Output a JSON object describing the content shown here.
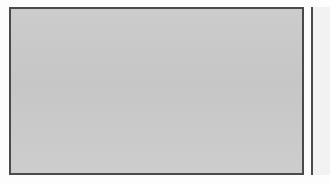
{
  "chart_data": {
    "type": "line",
    "xlabel": "",
    "ylabel": "Rate per 1,000 women",
    "ylim": [
      0,
      45
    ],
    "yticks": [
      0,
      10,
      20,
      30,
      40
    ],
    "xlim": [
      1993,
      2009
    ],
    "xticks": [
      1994,
      1996,
      1998,
      2000,
      2002,
      2004,
      2006,
      2008
    ],
    "x": [
      1993,
      1994,
      1995,
      1996,
      1997,
      1998,
      1999,
      2000,
      2001,
      2002,
      2003,
      2004,
      2005,
      2006,
      2007,
      2008,
      2009
    ],
    "grid": "horizontal",
    "legend_position": "top-center",
    "series": [
      {
        "name": "12–17",
        "color": "#4a4a4a",
        "values": [
          32.0,
          35.5,
          38.0,
          35.5,
          31.0,
          26.0,
          22.0,
          18.0,
          15.0,
          12.5,
          11.5,
          10.5,
          10.0,
          9.5,
          9.0,
          8.0,
          7.5
        ]
      },
      {
        "name": "18–24",
        "color": "#5a5a5a",
        "values": [
          35.0,
          36.5,
          41.5,
          40.5,
          38.5,
          32.5,
          24.5,
          23.5,
          22.5,
          22.0,
          20.0,
          19.0,
          22.0,
          23.5,
          20.0,
          17.0,
          13.0
        ]
      },
      {
        "name": "25–34",
        "color": "#6b6b6b",
        "values": [
          18.0,
          15.0,
          11.5,
          10.0,
          8.0,
          7.5,
          5.5,
          4.5,
          5.5,
          6.5,
          6.5,
          6.0,
          7.0,
          8.0,
          9.0,
          10.5,
          10.5
        ]
      },
      {
        "name": "35–49",
        "color": "#777777",
        "values": [
          7.5,
          9.5,
          12.0,
          16.0,
          14.0,
          12.0,
          10.0,
          8.0,
          6.5,
          6.5,
          4.0,
          2.5,
          2.5,
          2.5,
          2.5,
          2.5,
          2.5
        ]
      },
      {
        "name": "50 or older",
        "color": "#a6a6a6",
        "values": [
          2.0,
          2.0,
          2.0,
          2.0,
          2.0,
          2.0,
          2.0,
          2.0,
          2.0,
          2.0,
          2.0,
          2.0,
          2.0,
          2.0,
          2.0,
          1.8,
          1.5
        ]
      }
    ]
  },
  "figure": {
    "legend_title": "Age",
    "y_axis_label": "Rate per 1,000 women"
  }
}
